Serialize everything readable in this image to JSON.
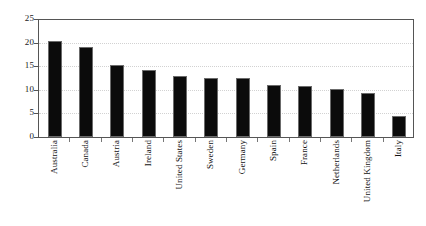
{
  "chart_data": {
    "type": "bar",
    "title": "",
    "subtitle": "",
    "xlabel": "",
    "ylabel": "",
    "categories": [
      "Australia",
      "Canada",
      "Austria",
      "Ireland",
      "United States",
      "Sweden",
      "Germany",
      "Spain",
      "France",
      "Netherlands",
      "United Kingdom",
      "Italy"
    ],
    "values": [
      20.3,
      19.0,
      15.2,
      14.2,
      12.9,
      12.5,
      12.4,
      11.1,
      10.7,
      10.2,
      9.3,
      4.4
    ],
    "ylim": [
      0,
      25
    ],
    "yticks": [
      0,
      5,
      10,
      15,
      20,
      25
    ],
    "ytick_labels": [
      "0",
      "5",
      "10",
      "15",
      "20",
      "25"
    ],
    "grid": true,
    "grid_axis": "y",
    "legend": false,
    "legend_position": "none",
    "bar_color": "#0b0b0b",
    "bar_edge_color": "#6b6b6b",
    "plot_background": "#ffffff",
    "gridline_color": "#d2d2d2",
    "axis_color": "#555555",
    "xlabel_rotation": -90
  },
  "layout": {
    "plot_left": 38,
    "plot_right": 414,
    "plot_top": 19,
    "plot_bottom": 137,
    "bar_width": 14,
    "slot_count": 12,
    "xlabels_top": 140
  }
}
